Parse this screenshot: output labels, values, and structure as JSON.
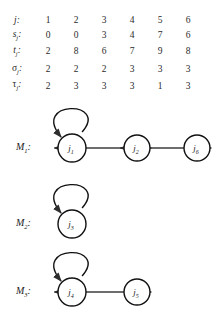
{
  "figure": {
    "table_top": {
      "rows": [
        {
          "label_main": "j",
          "label_sub": "",
          "values": [
            "1",
            "2",
            "3",
            "4",
            "5",
            "6"
          ]
        },
        {
          "label_main": "s",
          "label_sub": "j",
          "values": [
            "0",
            "0",
            "3",
            "4",
            "7",
            "6"
          ]
        },
        {
          "label_main": "t",
          "label_sub": "j",
          "values": [
            "2",
            "8",
            "6",
            "7",
            "9",
            "8"
          ]
        }
      ]
    },
    "table_bottom": {
      "rows": [
        {
          "label_main": "σ",
          "label_sub": "j",
          "values": [
            "2",
            "2",
            "2",
            "3",
            "3",
            "3"
          ]
        },
        {
          "label_main": "τ",
          "label_sub": "j",
          "values": [
            "2",
            "3",
            "3",
            "3",
            "1",
            "3"
          ]
        }
      ]
    },
    "graphs": [
      {
        "name": "M1",
        "label_main": "M",
        "label_sub": "1",
        "label_suffix": ":",
        "nodes": [
          {
            "id": "n1",
            "label_main": "j",
            "label_sub": "1",
            "cx": 72,
            "cy": 44,
            "r": 14
          },
          {
            "id": "n2",
            "label_main": "j",
            "label_sub": "2",
            "cx": 137,
            "cy": 44,
            "r": 13
          },
          {
            "id": "n3",
            "label_main": "j",
            "label_sub": "6",
            "cx": 197,
            "cy": 44,
            "r": 13
          }
        ],
        "edges": [
          {
            "from": "n2",
            "to": "n1"
          },
          {
            "from": "n3",
            "to": "n2"
          }
        ],
        "self_loops": [
          "n1"
        ]
      },
      {
        "name": "M2",
        "label_main": "M",
        "label_sub": "2",
        "label_suffix": ":",
        "nodes": [
          {
            "id": "n1",
            "label_main": "j",
            "label_sub": "3",
            "cx": 72,
            "cy": 40,
            "r": 14
          }
        ],
        "edges": [],
        "self_loops": [
          "n1"
        ]
      },
      {
        "name": "M3",
        "label_main": "M",
        "label_sub": "3",
        "label_suffix": ":",
        "nodes": [
          {
            "id": "n1",
            "label_main": "j",
            "label_sub": "4",
            "cx": 72,
            "cy": 44,
            "r": 14
          },
          {
            "id": "n2",
            "label_main": "j",
            "label_sub": "5",
            "cx": 137,
            "cy": 44,
            "r": 13
          }
        ],
        "edges": [
          {
            "from": "n2",
            "to": "n1"
          }
        ],
        "self_loops": [
          "n1"
        ]
      }
    ],
    "colors": {
      "ink": "#1a1a1a",
      "edge": "#3d3d3d",
      "node_fill": "#ffffff",
      "background": "#ffffff"
    }
  }
}
